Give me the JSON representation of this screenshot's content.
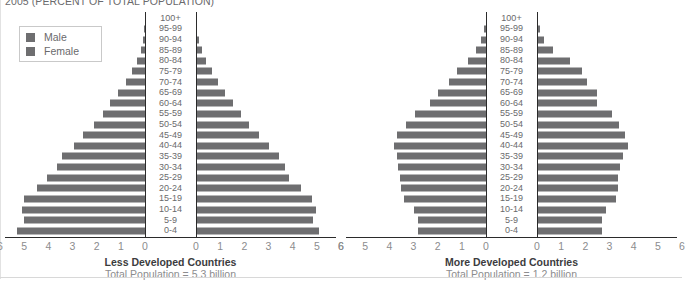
{
  "title": "2005 (PERCENT OF TOTAL POPULATION)",
  "legend": {
    "male_label": "Male",
    "female_label": "Female",
    "male_color": "#6e6e70",
    "female_color": "#6e6e70"
  },
  "axis": {
    "ticks": [
      "6",
      "5",
      "4",
      "3",
      "2",
      "1",
      "0",
      "0",
      "1",
      "2",
      "3",
      "4",
      "5",
      "6"
    ],
    "max": 6
  },
  "panels": [
    {
      "id": "less-developed",
      "caption_title": "Less Developed Countries",
      "caption_sub": "Total Population = 5.3 billion"
    },
    {
      "id": "more-developed",
      "caption_title": "More Developed Countries",
      "caption_sub": "Total Population = 1.2 billion"
    }
  ],
  "chart_data": {
    "type": "bar",
    "subtype": "population-pyramid",
    "title": "2005 (PERCENT OF TOTAL POPULATION)",
    "xlabel": "Percent of total population",
    "ylabel": "Age group",
    "xlim": [
      0,
      6
    ],
    "grid": false,
    "legend_position": "top-left",
    "categories": [
      "100+",
      "95-99",
      "90-94",
      "85-89",
      "80-84",
      "75-79",
      "70-74",
      "65-69",
      "60-64",
      "55-59",
      "50-54",
      "45-49",
      "40-44",
      "35-39",
      "30-34",
      "25-29",
      "20-24",
      "15-19",
      "10-14",
      "5-9",
      "0-4"
    ],
    "charts": [
      {
        "name": "Less Developed Countries",
        "total_population": "5.3 billion",
        "series": [
          {
            "name": "Male",
            "side": "left",
            "values": [
              0.01,
              0.03,
              0.08,
              0.18,
              0.33,
              0.55,
              0.8,
              1.1,
              1.45,
              1.75,
              2.1,
              2.55,
              2.95,
              3.45,
              3.65,
              4.05,
              4.45,
              5.0,
              5.1,
              5.0,
              5.3
            ]
          },
          {
            "name": "Female",
            "side": "right",
            "values": [
              0.01,
              0.04,
              0.12,
              0.25,
              0.42,
              0.68,
              0.92,
              1.2,
              1.55,
              1.85,
              2.2,
              2.6,
              3.0,
              3.45,
              3.7,
              3.85,
              4.35,
              4.8,
              4.95,
              4.85,
              5.1
            ]
          }
        ]
      },
      {
        "name": "More Developed Countries",
        "total_population": "1.2 billion",
        "series": [
          {
            "name": "Male",
            "side": "left",
            "values": [
              0.02,
              0.08,
              0.22,
              0.42,
              0.75,
              1.2,
              1.55,
              2.0,
              2.3,
              2.95,
              3.3,
              3.7,
              3.8,
              3.7,
              3.65,
              3.55,
              3.5,
              3.4,
              3.0,
              2.8,
              2.8
            ]
          },
          {
            "name": "Female",
            "side": "right",
            "values": [
              0.04,
              0.13,
              0.28,
              0.65,
              1.35,
              1.85,
              2.05,
              2.5,
              2.5,
              3.1,
              3.4,
              3.65,
              3.75,
              3.55,
              3.45,
              3.35,
              3.35,
              3.25,
              2.85,
              2.7,
              2.7
            ]
          }
        ]
      }
    ]
  }
}
